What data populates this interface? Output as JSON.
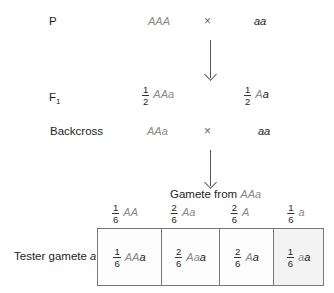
{
  "rows": {
    "p": {
      "label": "P",
      "parent1": {
        "parts": [
          {
            "text": "AAA",
            "tone": "gray"
          }
        ]
      },
      "cross": "×",
      "parent2": {
        "parts": [
          {
            "text": "aa",
            "tone": "black"
          }
        ]
      }
    },
    "f1": {
      "label": "F",
      "label_sub": "1",
      "offspring": [
        {
          "num": "1",
          "den": "2",
          "parts": [
            {
              "text": "AAa",
              "tone": "gray"
            }
          ]
        },
        {
          "num": "1",
          "den": "2",
          "parts": [
            {
              "text": "A",
              "tone": "gray"
            },
            {
              "text": "a",
              "tone": "black"
            }
          ]
        }
      ]
    },
    "backcross": {
      "label": "Backcross",
      "parent1": "AAa",
      "cross": "×",
      "parent2": "aa"
    }
  },
  "gamete_header": {
    "prefix": "Gamete from ",
    "genotype": "AAa"
  },
  "gametes": [
    {
      "num": "1",
      "den": "6",
      "g": "AA",
      "k": ""
    },
    {
      "num": "2",
      "den": "6",
      "g": "Aa",
      "k": ""
    },
    {
      "num": "2",
      "den": "6",
      "g": "A",
      "k": ""
    },
    {
      "num": "1",
      "den": "6",
      "g": "a",
      "k": ""
    }
  ],
  "tester": {
    "label_prefix": "Tester gamete ",
    "label_allele": "a"
  },
  "offspring_cells": [
    {
      "num": "1",
      "den": "6",
      "g": "AA",
      "k": "a"
    },
    {
      "num": "2",
      "den": "6",
      "g": "Aa",
      "k": "a"
    },
    {
      "num": "2",
      "den": "6",
      "g": "A",
      "k": "a"
    },
    {
      "num": "1",
      "den": "6",
      "g": "a",
      "k": "a"
    }
  ],
  "colors": {
    "parent_allele": "#8a8a8a",
    "tester_allele": "#1a1a1a",
    "border": "#777777"
  }
}
